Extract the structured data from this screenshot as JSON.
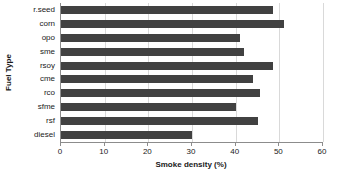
{
  "chart_data": {
    "type": "bar",
    "orientation": "horizontal",
    "title": "",
    "xlabel": "Smoke density (%)",
    "ylabel": "Fuel Type",
    "categories": [
      "r.seed",
      "corn",
      "opo",
      "sme",
      "rsoy",
      "cme",
      "rco",
      "sfme",
      "rsf",
      "diesel"
    ],
    "values": [
      48.5,
      51,
      41,
      42,
      48.5,
      44,
      45.5,
      40,
      45,
      30
    ],
    "xlim": [
      0,
      60
    ],
    "xticks": [
      0,
      10,
      20,
      30,
      40,
      50,
      60
    ],
    "xtick_labels": [
      "0",
      "10",
      "20",
      "30",
      "40",
      "50",
      "60"
    ],
    "grid": true,
    "grid_axis": "x",
    "legend": false,
    "bar_color": "#414141",
    "gridline_color": "#d9d9d9",
    "axis_color": "#8c8c8c"
  }
}
